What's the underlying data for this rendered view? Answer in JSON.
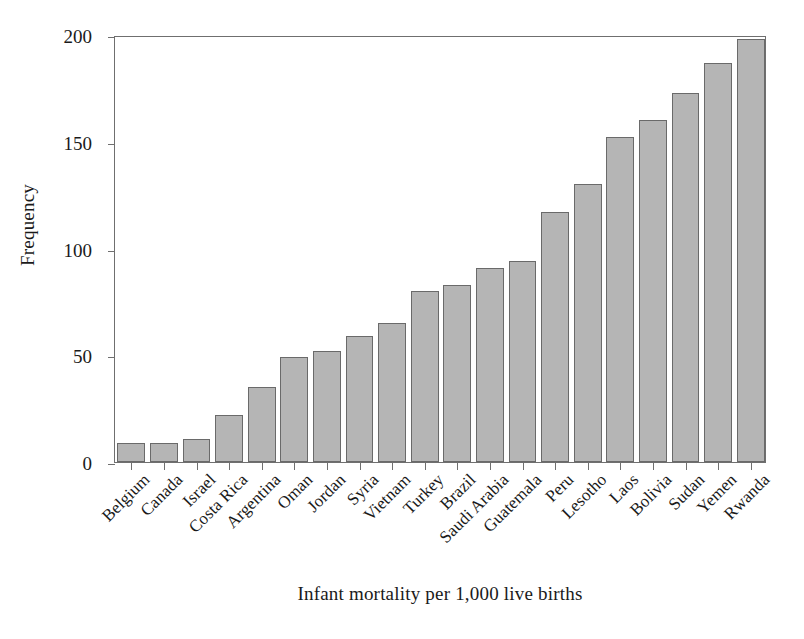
{
  "chart_data": {
    "type": "bar",
    "title": "",
    "xlabel": "Infant mortality per 1,000 live births",
    "ylabel": "Frequency",
    "categories": [
      "Belgium",
      "Canada",
      "Israel",
      "Costa Rica",
      "Argentina",
      "Oman",
      "Jordan",
      "Syria",
      "Vietnam",
      "Turkey",
      "Brazil",
      "Saudi Arabia",
      "Guatemala",
      "Peru",
      "Lesotho",
      "Laos",
      "Bolivia",
      "Sudan",
      "Yemen",
      "Rwanda"
    ],
    "values": [
      9,
      9,
      11,
      22,
      35,
      49,
      52,
      59,
      65,
      80,
      83,
      91,
      94,
      117,
      130,
      152,
      160,
      173,
      187,
      198
    ],
    "ylim": [
      0,
      200
    ],
    "yticks": [
      0,
      50,
      100,
      150,
      200
    ],
    "ytick_labels": [
      "0",
      "50",
      "100",
      "150",
      "200"
    ],
    "grid": false,
    "legend": false,
    "bar_fill_color": "#b5b5b5",
    "bar_edge_color": "#6a6a6a",
    "axis_color": "#6f6f6f",
    "background_color": "#ffffff"
  }
}
